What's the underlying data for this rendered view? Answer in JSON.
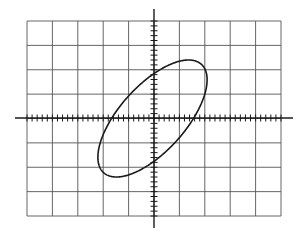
{
  "figure": {
    "background": "#ffffff",
    "line_color": "#1a1a1a",
    "grid_color": "#555555"
  },
  "screen": {
    "left": 27,
    "top": 21,
    "right": 281,
    "bottom": 216,
    "h_divisions": 10,
    "v_divisions": 8,
    "minor_ticks_per_division": 5
  },
  "axes": {
    "center_x": 154,
    "center_y": 118,
    "h_axis_extent": [
      15,
      293
    ],
    "v_axis_extent": [
      9,
      228
    ]
  },
  "trace": {
    "shape": "ellipse",
    "x_amplitude_div": 2.15,
    "y_amplitude_div": 2.4,
    "phase_deg": 48.6,
    "x_intercept_div": 1.6,
    "y_intercept_div": 1.8,
    "center_offset_px": [
      -1.5,
      0.5
    ]
  }
}
